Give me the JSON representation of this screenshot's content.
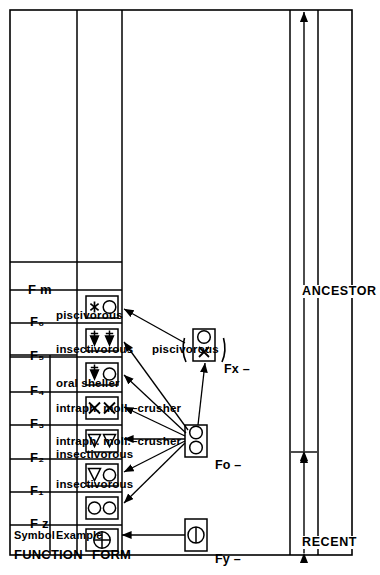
{
  "figure": {
    "orientation": "rotated-90-ccw"
  },
  "columns": {
    "form_header": "FORM",
    "function_header": "FUNCTION",
    "symbol_header": "Symbol",
    "example_header": "Example"
  },
  "rows": [
    {
      "symbol": "F z",
      "example": "",
      "form_glyphs": [
        "circle-plus"
      ]
    },
    {
      "symbol": "F₁",
      "example": "insectivorous",
      "form_glyphs": [
        "circle",
        "circle"
      ]
    },
    {
      "symbol": "F₂",
      "example": "insectivorous\nintraph. moll.–crusher",
      "form_glyphs": [
        "triangle",
        "circle"
      ]
    },
    {
      "symbol": "F₃",
      "example": "intraph. moll.–crusher",
      "form_glyphs": [
        "triangle",
        "triangle"
      ]
    },
    {
      "symbol": "F₄",
      "example": "oral sheller",
      "form_glyphs": [
        "x",
        "x"
      ]
    },
    {
      "symbol": "F₅",
      "example": "insectivorous    piscivorous",
      "form_glyphs": [
        "fish",
        "circle"
      ]
    },
    {
      "symbol": "F₆",
      "example": "piscivorous",
      "form_glyphs": [
        "fish",
        "fish"
      ]
    },
    {
      "symbol": "F m",
      "example": "",
      "form_glyphs": [
        "asterisk",
        "circle"
      ]
    }
  ],
  "ancestors": [
    {
      "label": "Fy –",
      "glyphs": [
        "circle-minus"
      ],
      "parenthesized": false
    },
    {
      "label": "Fo –",
      "glyphs": [
        "circle",
        "circle"
      ],
      "parenthesized": false
    },
    {
      "label": "Fx –",
      "glyphs": [
        "x",
        "circle"
      ],
      "parenthesized": true
    }
  ],
  "timescale": {
    "recent_label": "RECENT",
    "ancestor_label": "ANCESTOR"
  },
  "example_lines": {
    "r1": [
      "insectivorous"
    ],
    "r2": [
      "insectivorous",
      "intraph. moll.–crusher"
    ],
    "r3": [
      "intraph. moll.–crusher"
    ],
    "r4": [
      "oral sheller"
    ],
    "r5a": "insectivorous",
    "r5b": "piscivorous",
    "r6": [
      "piscivorous"
    ]
  }
}
